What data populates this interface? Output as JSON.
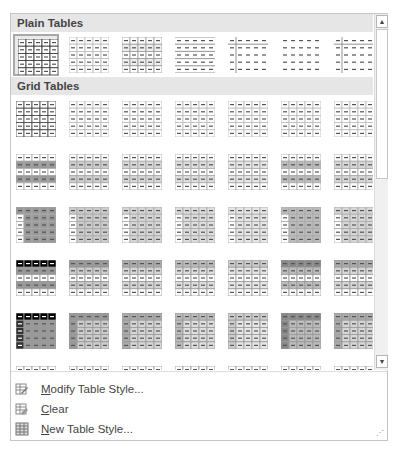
{
  "sections": [
    {
      "title": "Plain Tables",
      "rows": 1
    },
    {
      "title": "Grid Tables",
      "rows": 6
    }
  ],
  "scrollbar": {
    "up_icon": "▲",
    "down_icon": "▼"
  },
  "menu": {
    "items": [
      {
        "label": "Modify Table Style...",
        "accel": "M",
        "icon": "modify-table-style-icon"
      },
      {
        "label": "Clear",
        "accel": "C",
        "icon": "clear-table-style-icon"
      },
      {
        "label": "New Table Style...",
        "accel": "N",
        "icon": "new-table-style-icon"
      }
    ]
  },
  "colors": {
    "header_bg": "#e6e6e6",
    "selected_border": "#a8a8a8",
    "frame_border": "#c6c6c6"
  }
}
